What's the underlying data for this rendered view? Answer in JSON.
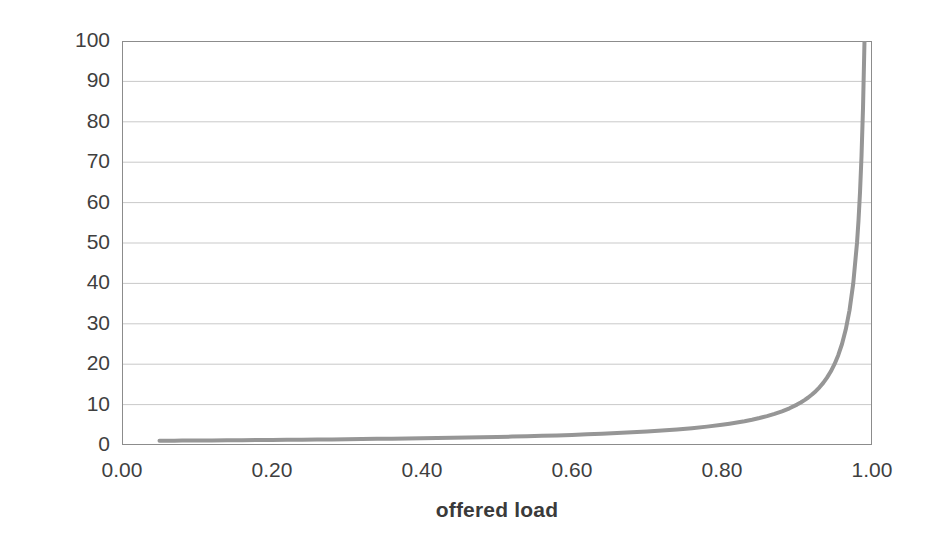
{
  "chart_data": {
    "type": "line",
    "title": "",
    "subtitle": "",
    "xlabel": "offered load",
    "ylabel": "latency",
    "xlim": [
      0.0,
      1.0
    ],
    "ylim": [
      0,
      100
    ],
    "grid": true,
    "grid_axis": "y",
    "legend": false,
    "legend_position": "none",
    "x_tick_labels": [
      "0.00",
      "0.20",
      "0.40",
      "0.60",
      "0.80",
      "1.00"
    ],
    "x_ticks": [
      0.0,
      0.2,
      0.4,
      0.6,
      0.8,
      1.0
    ],
    "x_minor_ticks": [
      0.1,
      0.3,
      0.5,
      0.7,
      0.9
    ],
    "y_tick_labels": [
      "0",
      "10",
      "20",
      "30",
      "40",
      "50",
      "60",
      "70",
      "80",
      "90",
      "100"
    ],
    "y_ticks": [
      0,
      10,
      20,
      30,
      40,
      50,
      60,
      70,
      80,
      90,
      100
    ],
    "series": [
      {
        "name": "latency",
        "color": "#969696",
        "line_width": 4,
        "formula": "latency = 1 / (1 - offered_load)",
        "x": [
          0.05,
          0.06,
          0.07,
          0.08,
          0.09,
          0.1,
          0.12,
          0.14,
          0.16,
          0.18,
          0.2,
          0.22,
          0.24,
          0.26,
          0.28,
          0.3,
          0.32,
          0.34,
          0.36,
          0.38,
          0.4,
          0.42,
          0.44,
          0.46,
          0.48,
          0.5,
          0.52,
          0.54,
          0.56,
          0.58,
          0.6,
          0.62,
          0.64,
          0.66,
          0.68,
          0.7,
          0.72,
          0.74,
          0.76,
          0.78,
          0.8,
          0.81,
          0.82,
          0.83,
          0.84,
          0.85,
          0.86,
          0.87,
          0.88,
          0.89,
          0.9,
          0.905,
          0.91,
          0.915,
          0.92,
          0.925,
          0.93,
          0.935,
          0.94,
          0.945,
          0.95,
          0.955,
          0.96,
          0.965,
          0.97,
          0.975,
          0.98,
          0.982,
          0.984,
          0.986,
          0.988,
          0.99
        ],
        "y": [
          1.05,
          1.06,
          1.08,
          1.09,
          1.1,
          1.11,
          1.14,
          1.16,
          1.19,
          1.22,
          1.25,
          1.28,
          1.32,
          1.35,
          1.39,
          1.43,
          1.47,
          1.52,
          1.56,
          1.61,
          1.67,
          1.72,
          1.79,
          1.85,
          1.92,
          2.0,
          2.08,
          2.17,
          2.27,
          2.38,
          2.5,
          2.63,
          2.78,
          2.94,
          3.13,
          3.33,
          3.57,
          3.85,
          4.17,
          4.55,
          5.0,
          5.26,
          5.56,
          5.88,
          6.25,
          6.67,
          7.14,
          7.69,
          8.33,
          9.09,
          10.0,
          10.53,
          11.11,
          11.76,
          12.5,
          13.33,
          14.29,
          15.38,
          16.67,
          18.18,
          20.0,
          22.22,
          25.0,
          28.57,
          33.33,
          40.0,
          50.0,
          55.56,
          62.5,
          71.43,
          83.33,
          100.0
        ]
      }
    ],
    "annotations": [],
    "colors": {
      "curve": "#969696",
      "gridline": "#c9c9c9",
      "axis": "#8c8c8c",
      "text": "#3f3f3f",
      "background": "#ffffff"
    }
  }
}
